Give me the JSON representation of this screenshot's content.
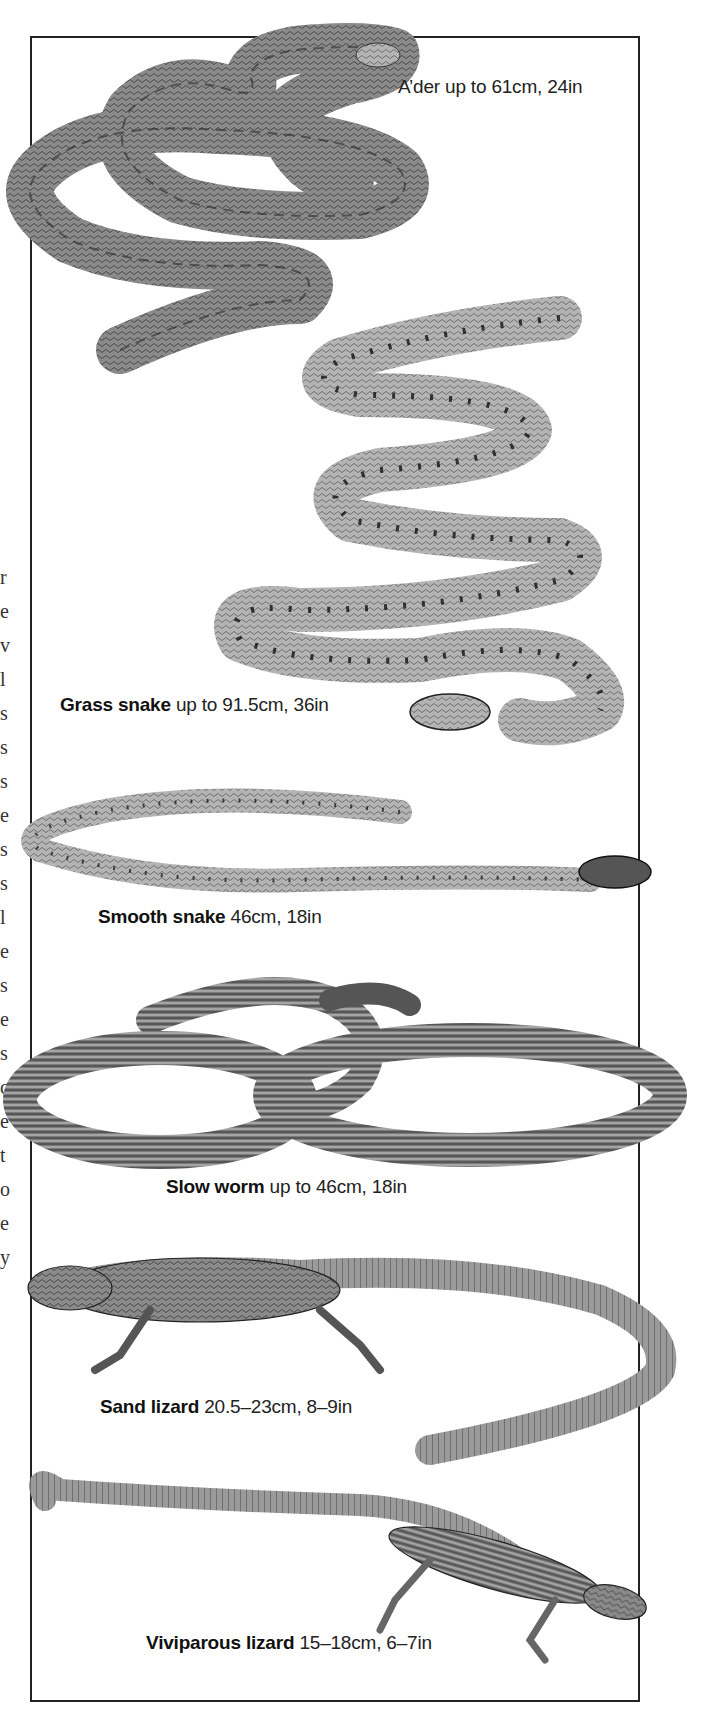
{
  "page": {
    "type": "field-guide plate",
    "border_color": "#222222",
    "background": "#ffffff",
    "margin_fragments": "r\ne\nv\nl\ns\ns\ns\ne\ns\ns\nl\ne\ns\ne\ns\nc\ne\nt\no\ne\ny"
  },
  "species": [
    {
      "id": "adder",
      "name": "Adder",
      "size": "up to 61cm, 24in",
      "name_rendered": "A’der",
      "kind": "snake"
    },
    {
      "id": "grass-snake",
      "name": "Grass snake",
      "size": "up to 91.5cm, 36in",
      "kind": "snake"
    },
    {
      "id": "smooth-snake",
      "name": "Smooth snake",
      "size": "46cm, 18in",
      "kind": "snake"
    },
    {
      "id": "slow-worm",
      "name": "Slow worm",
      "size": "up to 46cm, 18in",
      "kind": "legless lizard"
    },
    {
      "id": "sand-lizard",
      "name": "Sand lizard",
      "size": "20.5–23cm, 8–9in",
      "kind": "lizard"
    },
    {
      "id": "viviparous-lizard",
      "name": "Viviparous lizard",
      "size": "15–18cm, 6–7in",
      "kind": "lizard"
    }
  ]
}
